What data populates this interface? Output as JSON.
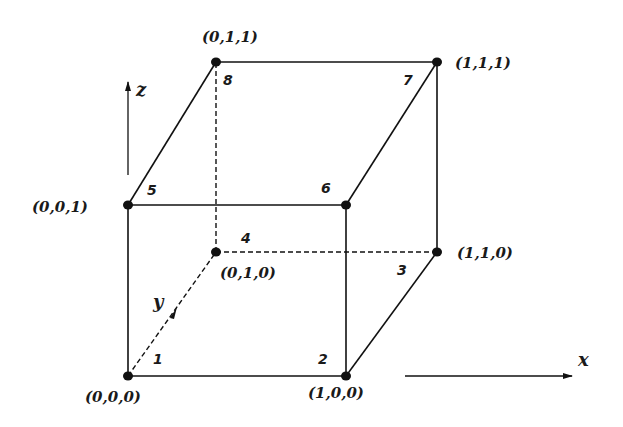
{
  "axes": {
    "x": "x",
    "y": "y",
    "z": "z"
  },
  "vertices": [
    {
      "id": "1",
      "coord": "(0,0,0)"
    },
    {
      "id": "2",
      "coord": "(1,0,0)"
    },
    {
      "id": "3",
      "coord": "(1,1,0)"
    },
    {
      "id": "4",
      "coord": "(0,1,0)"
    },
    {
      "id": "5",
      "coord": "(0,0,1)"
    },
    {
      "id": "6",
      "coord": ""
    },
    {
      "id": "7",
      "coord": "(1,1,1)"
    },
    {
      "id": "8",
      "coord": "(0,1,1)"
    }
  ],
  "edges": {
    "solid": [
      [
        "1",
        "2"
      ],
      [
        "1",
        "5"
      ],
      [
        "2",
        "6"
      ],
      [
        "5",
        "6"
      ],
      [
        "2",
        "3"
      ],
      [
        "3",
        "7"
      ],
      [
        "6",
        "7"
      ],
      [
        "5",
        "8"
      ],
      [
        "8",
        "7"
      ]
    ],
    "dashed": [
      [
        "1",
        "4"
      ],
      [
        "4",
        "3"
      ],
      [
        "4",
        "8"
      ]
    ]
  }
}
